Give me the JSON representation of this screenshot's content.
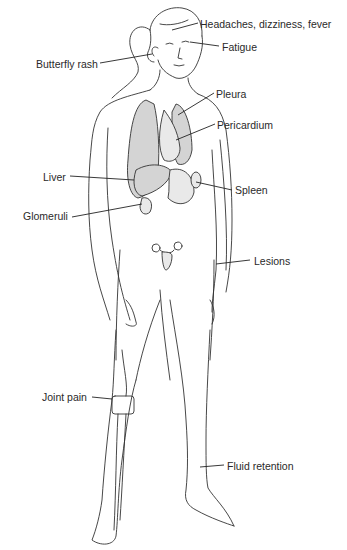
{
  "figure": {
    "labels": [
      {
        "id": "headaches",
        "text": "Headaches, dizziness, fever",
        "x": 200,
        "y": 18
      },
      {
        "id": "fatigue",
        "text": "Fatigue",
        "x": 222,
        "y": 41
      },
      {
        "id": "butterfly-rash",
        "text": "Butterfly rash",
        "x": 36,
        "y": 58
      },
      {
        "id": "pleura",
        "text": "Pleura",
        "x": 216,
        "y": 88
      },
      {
        "id": "pericardium",
        "text": "Pericardium",
        "x": 217,
        "y": 119
      },
      {
        "id": "liver",
        "text": "Liver",
        "x": 43,
        "y": 171
      },
      {
        "id": "spleen",
        "text": "Spleen",
        "x": 235,
        "y": 184
      },
      {
        "id": "glomeruli",
        "text": "Glomeruli",
        "x": 23,
        "y": 210
      },
      {
        "id": "lesions",
        "text": "Lesions",
        "x": 254,
        "y": 255
      },
      {
        "id": "joint-pain",
        "text": "Joint pain",
        "x": 42,
        "y": 391
      },
      {
        "id": "fluid-retention",
        "text": "Fluid retention",
        "x": 227,
        "y": 460
      }
    ]
  }
}
